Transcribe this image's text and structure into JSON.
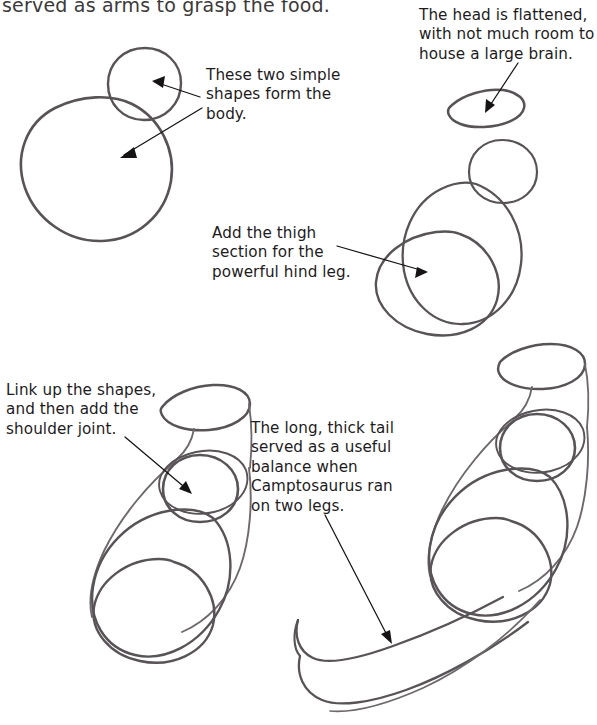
{
  "page": {
    "background_color": "#ffffff",
    "ink_color": "#1d1b1c",
    "pencil_color": "#585356"
  },
  "top_text": {
    "clipped_line": "served as arms to grasp the food."
  },
  "callouts": [
    {
      "id": "body-shapes",
      "text": "These two simple\nshapes form the\nbody.",
      "x": 206,
      "y": 66
    },
    {
      "id": "head-flattened",
      "text": "The head is flattened,\nwith not much room to\nhouse a large brain.",
      "x": 419,
      "y": 6
    },
    {
      "id": "thigh-section",
      "text": "Add the thigh\nsection for the\npowerful hind leg.",
      "x": 212,
      "y": 224
    },
    {
      "id": "shoulder-joint",
      "text": "Link up the shapes,\nand then add the\nshoulder joint.",
      "x": 6,
      "y": 381
    },
    {
      "id": "long-thick-tail",
      "text": "The long, thick tail\nserved as a useful\nbalance when\nCamptosaurus ran\non two legs.",
      "x": 251,
      "y": 419
    }
  ],
  "steps": [
    {
      "id": "step-1",
      "name": "head-and-body-shapes",
      "shapes": [
        "head-circle",
        "body-ellipse"
      ]
    },
    {
      "id": "step-2",
      "name": "flattened-head-plus-thigh",
      "shapes": [
        "flattened-head-ellipse",
        "head-circle",
        "body-ellipse",
        "thigh-ellipse"
      ]
    },
    {
      "id": "step-3",
      "name": "linked-shapes-with-shoulder",
      "shapes": [
        "flattened-head-ellipse",
        "neck-lines",
        "shoulder-circle",
        "body-ellipse",
        "thigh-ellipse",
        "torso-outline"
      ]
    },
    {
      "id": "step-4",
      "name": "with-tail",
      "shapes": [
        "flattened-head-ellipse",
        "neck-lines",
        "shoulder-circle",
        "body-ellipse",
        "thigh-ellipse",
        "torso-outline",
        "tail-curve"
      ]
    }
  ]
}
